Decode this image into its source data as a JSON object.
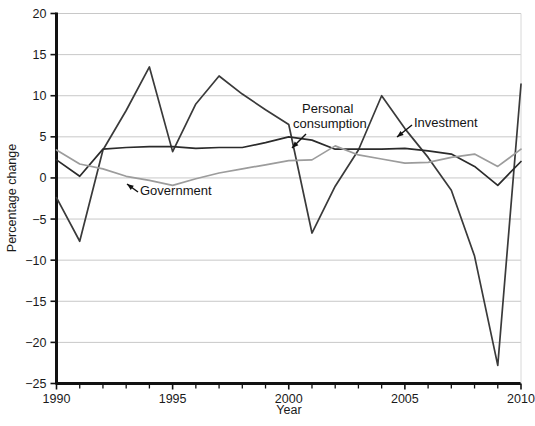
{
  "chart_data": {
    "type": "line",
    "title": "",
    "xlabel": "Year",
    "ylabel": "Percentage change",
    "xlim": [
      1990,
      2010
    ],
    "ylim": [
      -25,
      20
    ],
    "xticks": [
      1990,
      1991,
      1992,
      1993,
      1994,
      1995,
      1996,
      1997,
      1998,
      1999,
      2000,
      2001,
      2002,
      2003,
      2004,
      2005,
      2006,
      2007,
      2008,
      2009,
      2010
    ],
    "xtick_labels": [
      "1990",
      "",
      "",
      "",
      "",
      "1995",
      "",
      "",
      "",
      "",
      "2000",
      "",
      "",
      "",
      "",
      "2005",
      "",
      "",
      "",
      "",
      "2010"
    ],
    "yticks": [
      -25,
      -20,
      -15,
      -10,
      -5,
      0,
      5,
      10,
      15,
      20
    ],
    "ytick_labels": [
      "−25",
      "−20",
      "−15",
      "−10",
      "−5",
      "0",
      "5",
      "10",
      "15",
      "20"
    ],
    "grid": "horizontal",
    "legend_position": "inline-annotations",
    "x": [
      1990,
      1991,
      1992,
      1993,
      1994,
      1995,
      1996,
      1997,
      1998,
      1999,
      2000,
      2001,
      2002,
      2003,
      2004,
      2005,
      2006,
      2007,
      2008,
      2009,
      2010
    ],
    "series": [
      {
        "name": "Investment",
        "color": "#3a3a3a",
        "values": [
          -2.4,
          -7.7,
          3.4,
          8.2,
          13.5,
          3.2,
          9.0,
          12.4,
          10.2,
          8.3,
          6.5,
          -6.7,
          -1.0,
          3.4,
          10.0,
          6.0,
          2.5,
          -1.5,
          -9.5,
          -22.8,
          11.4
        ]
      },
      {
        "name": "Personal consumption",
        "color": "#2b2b2b",
        "values": [
          2.2,
          0.2,
          3.5,
          3.7,
          3.8,
          3.8,
          3.6,
          3.7,
          3.7,
          4.3,
          5.0,
          4.6,
          3.5,
          3.5,
          3.5,
          3.6,
          3.3,
          2.9,
          1.4,
          -0.9,
          2.0
        ]
      },
      {
        "name": "Government",
        "color": "#9c9c9c",
        "values": [
          3.4,
          1.7,
          1.1,
          0.2,
          -0.3,
          -0.9,
          -0.1,
          0.6,
          1.1,
          1.6,
          2.1,
          2.2,
          3.9,
          2.8,
          2.3,
          1.8,
          1.9,
          2.5,
          2.9,
          1.4,
          3.5
        ]
      }
    ],
    "annotations": [
      {
        "text": "Government",
        "target_year": 1995,
        "target_value": -0.9
      },
      {
        "text_line1": "Personal",
        "text_line2": "consumption",
        "target_year": 2000.6,
        "target_value": 4.0
      },
      {
        "text": "Investment",
        "target_year": 2005.5,
        "target_value": 5.4
      }
    ]
  }
}
